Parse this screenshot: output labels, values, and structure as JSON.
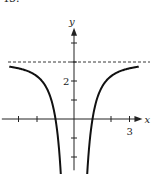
{
  "problem_number": "45.",
  "chart_data": {
    "type": "line",
    "title": "",
    "xlabel": "x",
    "ylabel": "y",
    "xlim": [
      -3.9,
      3.7
    ],
    "ylim": [
      -2.7,
      4.8
    ],
    "x_ticks": [
      -3,
      -2,
      -1,
      1,
      2,
      3
    ],
    "y_ticks": [
      -2,
      -1,
      1,
      2,
      3,
      4
    ],
    "x_tick_labels": [
      {
        "value": 3,
        "text": "3"
      }
    ],
    "y_tick_labels": [
      {
        "value": 2,
        "text": "2"
      }
    ],
    "asymptotes": [
      {
        "type": "horizontal",
        "y": 3,
        "style": "dashed"
      }
    ],
    "series": [
      {
        "name": "left branch",
        "x": [
          -3.5,
          -3,
          -2.5,
          -2,
          -1.5,
          -1.2,
          -1,
          -0.8,
          -0.7,
          -0.6
        ],
        "y": [
          2.76,
          2.67,
          2.52,
          2.25,
          1.67,
          0.92,
          0,
          -1.69,
          -3.12,
          -5.33
        ]
      },
      {
        "name": "right branch",
        "x": [
          0.6,
          0.7,
          0.8,
          1,
          1.2,
          1.5,
          2,
          2.5,
          3,
          3.5
        ],
        "y": [
          -5.33,
          -3.12,
          -1.69,
          0,
          0.92,
          1.67,
          2.25,
          2.52,
          2.67,
          2.76
        ]
      }
    ],
    "grid": false
  }
}
